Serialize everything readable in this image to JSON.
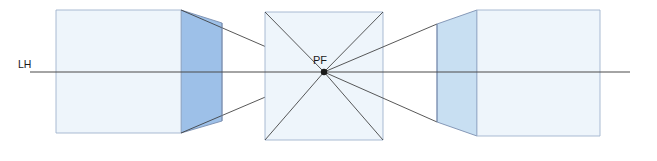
{
  "diagram": {
    "type": "one-point-perspective",
    "labels": {
      "horizon_line": "LH",
      "vanishing_point": "PF"
    },
    "credit": "Ilustrações: Banco de imagens/Arquivo da editora",
    "colors": {
      "front_face": "#eef5fb",
      "side_face_dark": "#9dc0e8",
      "side_face_light": "#c8dff2",
      "outline": "#7a8fb0",
      "line": "#3a3a3a",
      "credit_text": "#6e6e6e",
      "background": "#ffffff"
    },
    "geometry": {
      "canvas": [
        657,
        161
      ],
      "horizon_y": 72,
      "horizon_x_start": 30,
      "horizon_x_end": 630,
      "vanishing_point": [
        324,
        72
      ],
      "left_box": {
        "front": [
          56,
          10,
          181,
          133
        ],
        "depth_to": "vanishing-point"
      },
      "center_box": {
        "front": [
          265,
          12,
          383,
          140
        ]
      },
      "right_box": {
        "front": [
          477,
          10,
          600,
          136
        ],
        "depth_to": "vanishing-point"
      }
    }
  }
}
